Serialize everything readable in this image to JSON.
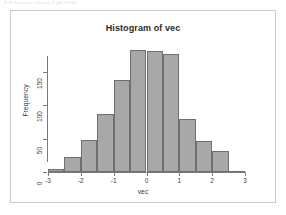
{
  "faint_header": "R R Graphics: Device 2 (ACTIVE)",
  "chart_data": {
    "type": "bar",
    "title": "Histogram of vec",
    "xlabel": "vec",
    "ylabel": "Frequency",
    "bin_width": 0.5,
    "bin_edges": [
      -3.0,
      -2.5,
      -2.0,
      -1.5,
      -1.0,
      -0.5,
      0.0,
      0.5,
      1.0,
      1.5,
      2.0,
      2.5,
      3.0
    ],
    "categories": [
      "-3.0 to -2.5",
      "-2.5 to -2.0",
      "-2.0 to -1.5",
      "-1.5 to -1.0",
      "-1.0 to -0.5",
      "-0.5 to 0.0",
      "0.0 to 0.5",
      "0.5 to 1.0",
      "1.0 to 1.5",
      "1.5 to 2.0",
      "2.0 to 2.5",
      "2.5 to 3.0"
    ],
    "values": [
      5,
      22,
      48,
      87,
      137,
      182,
      181,
      176,
      80,
      47,
      32,
      2
    ],
    "xlim": [
      -3,
      3
    ],
    "ylim": [
      0,
      190
    ],
    "xticks": [
      -3,
      -2,
      -1,
      0,
      1,
      2,
      3
    ],
    "xtick_labels": [
      "-3",
      "-2",
      "-1",
      "0",
      "1",
      "2",
      "3"
    ],
    "yticks": [
      0,
      50,
      100,
      150
    ],
    "ytick_labels": [
      "0",
      "50",
      "100",
      "150"
    ],
    "grid": false,
    "legend": null,
    "bar_fill": "#a8a8a8",
    "bar_border": "#6f6f6f"
  }
}
